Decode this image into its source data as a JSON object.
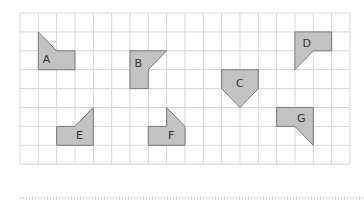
{
  "grid": {
    "left": 20,
    "top": 13,
    "cols": 18,
    "rows": 8,
    "cell_w": 18.33,
    "cell_h": 18.9,
    "line_color": "#d6d6d6"
  },
  "shapes": [
    {
      "label": "A",
      "points": [
        [
          1,
          1
        ],
        [
          2,
          2
        ],
        [
          3,
          2
        ],
        [
          3,
          3
        ],
        [
          1,
          3
        ]
      ],
      "label_pos": [
        1.45,
        2.5
      ]
    },
    {
      "label": "B",
      "points": [
        [
          6,
          2
        ],
        [
          8,
          2
        ],
        [
          7,
          3
        ],
        [
          7,
          4
        ],
        [
          6,
          4
        ]
      ],
      "label_pos": [
        6.45,
        2.7
      ]
    },
    {
      "label": "C",
      "points": [
        [
          11,
          3
        ],
        [
          13,
          3
        ],
        [
          13,
          4
        ],
        [
          12,
          5
        ],
        [
          11,
          4
        ]
      ],
      "label_pos": [
        12,
        3.75
      ]
    },
    {
      "label": "D",
      "points": [
        [
          15,
          1
        ],
        [
          17,
          1
        ],
        [
          17,
          2
        ],
        [
          16,
          2
        ],
        [
          15,
          3
        ]
      ],
      "label_pos": [
        15.65,
        1.65
      ]
    },
    {
      "label": "E",
      "points": [
        [
          4,
          5
        ],
        [
          4,
          7
        ],
        [
          2,
          7
        ],
        [
          2,
          6
        ],
        [
          3,
          6
        ]
      ],
      "label_pos": [
        3.25,
        6.5
      ]
    },
    {
      "label": "F",
      "points": [
        [
          8,
          5
        ],
        [
          9,
          6
        ],
        [
          9,
          7
        ],
        [
          7,
          7
        ],
        [
          7,
          6
        ],
        [
          8,
          6
        ]
      ],
      "label_pos": [
        8.25,
        6.5
      ]
    },
    {
      "label": "G",
      "points": [
        [
          14,
          5
        ],
        [
          16,
          5
        ],
        [
          16,
          7
        ],
        [
          15,
          6
        ],
        [
          14,
          6
        ]
      ],
      "label_pos": [
        15.35,
        5.6
      ]
    }
  ],
  "colors": {
    "shape_fill": "#c2c2c2",
    "shape_stroke": "#7a7a7a",
    "label": "#333333"
  },
  "answer_line": {
    "x1": 20,
    "x2": 364,
    "y": 198
  }
}
